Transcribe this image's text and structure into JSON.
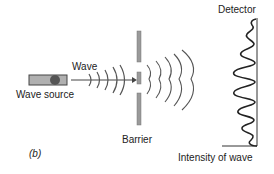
{
  "diagram": {
    "panel_label": "(b)",
    "labels": {
      "wave": "Wave",
      "wave_source": "Wave source",
      "barrier": "Barrier",
      "detector": "Detector",
      "intensity": "Intensity of wave"
    },
    "colors": {
      "line": "#333333",
      "barrier_fill": "#9a9a9a",
      "source_fill": "#a8a8a8",
      "source_dot": "#555555",
      "wave_stroke": "#555555"
    }
  }
}
